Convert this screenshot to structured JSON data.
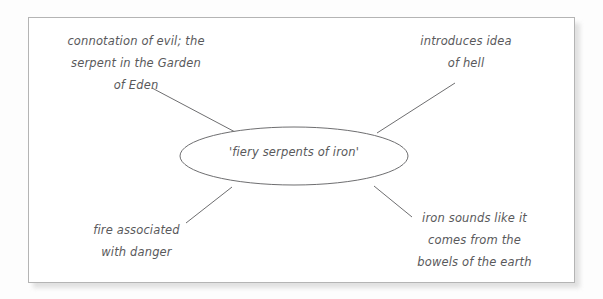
{
  "diagram": {
    "type": "spider-mind-map",
    "center": {
      "label": "'fiery serpents of iron'",
      "shape": "ellipse"
    },
    "branches": [
      {
        "id": "top-left",
        "label": "connotation of evil; the\nserpent in the Garden\nof Eden",
        "position": "top-left"
      },
      {
        "id": "top-right",
        "label": "introduces idea\nof hell",
        "position": "top-right"
      },
      {
        "id": "bottom-left",
        "label": "fire associated\nwith danger",
        "position": "bottom-left"
      },
      {
        "id": "bottom-right",
        "label": "iron sounds like it\ncomes from the\nbowels of the earth",
        "position": "bottom-right"
      }
    ],
    "colors": {
      "stroke": "#6e6e70",
      "text": "#59595b",
      "frame_border": "#b4b4b4",
      "page_background": "#ffffff"
    }
  }
}
